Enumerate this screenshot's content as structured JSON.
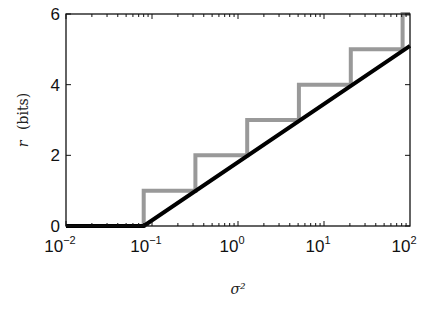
{
  "chart_data": {
    "type": "line",
    "title": "",
    "xlabel": "σ²",
    "ylabel_var": "r",
    "ylabel_unit": "(bits)",
    "xscale": "log",
    "xlim": [
      0.01,
      100
    ],
    "ylim": [
      0,
      6
    ],
    "grid": false,
    "legend": null,
    "xticks": [
      {
        "base": "10",
        "exp": "−2",
        "value": 0.01
      },
      {
        "base": "10",
        "exp": "−1",
        "value": 0.1
      },
      {
        "base": "10",
        "exp": "0",
        "value": 1
      },
      {
        "base": "10",
        "exp": "1",
        "value": 10
      },
      {
        "base": "10",
        "exp": "2",
        "value": 100
      }
    ],
    "yticks": [
      "0",
      "2",
      "4",
      "6"
    ],
    "series": [
      {
        "name": "continuous rate",
        "color": "#000000",
        "style": "solid-thick",
        "x": [
          0.01,
          0.08,
          100
        ],
        "y": [
          0,
          0,
          5.1
        ]
      },
      {
        "name": "integer (staircase) rate",
        "color": "#999999",
        "style": "step-thick",
        "x": [
          0.01,
          0.08,
          0.08,
          0.32,
          0.32,
          1.28,
          1.28,
          5.1,
          5.1,
          20.5,
          20.5,
          82,
          82,
          100
        ],
        "y": [
          0,
          0,
          1,
          1,
          2,
          2,
          3,
          3,
          4,
          4,
          5,
          5,
          6,
          6
        ]
      }
    ]
  }
}
